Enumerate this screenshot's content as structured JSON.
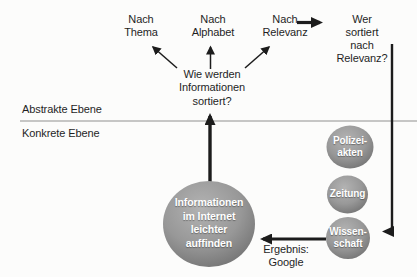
{
  "top_row": {
    "nach_thema": "Nach\nThema",
    "nach_alphabet": "Nach\nAlphabet",
    "nach_relevanz": "Nach\nRelevanz",
    "wer_sortiert": "Wer sortiert\nnach Relevanz?"
  },
  "question": "Wie werden\nInformationen\nsortiert?",
  "levels": {
    "abstract_label": "Abstrakte Ebene",
    "concrete_label": "Konkrete Ebene"
  },
  "goal_node_label": "Informationen\nim Internet\nleichter\nauffinden",
  "concrete_nodes": {
    "polizeiakten": "Polizei-\nakten",
    "zeitung": "Zeitung",
    "wissenschaft": "Wissen-\nschaft"
  },
  "result_label": "Ergebnis:\nGoogle",
  "colors": {
    "line": "#1c1c1c",
    "divider": "#8f8f8f",
    "text": "#1f1f1f",
    "node_highlight": "#b3b3b3",
    "node_mid": "#989898",
    "node_rim": "#6e6e6e",
    "node_text": "#ffffff",
    "background": "#fcfcfb"
  }
}
